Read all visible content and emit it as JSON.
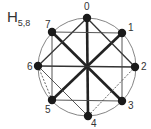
{
  "title": {
    "main": "H",
    "subscript": "5,8"
  },
  "circle": {
    "cx": 87,
    "cy": 67,
    "r": 49,
    "color": "#777777"
  },
  "nodes": [
    {
      "id": "0",
      "x": 87,
      "y": 18,
      "lx": 84,
      "ly": 10
    },
    {
      "id": "1",
      "x": 122,
      "y": 33,
      "lx": 128,
      "ly": 31
    },
    {
      "id": "2",
      "x": 135,
      "y": 67,
      "lx": 141,
      "ly": 70
    },
    {
      "id": "3",
      "x": 122,
      "y": 101,
      "lx": 128,
      "ly": 109
    },
    {
      "id": "4",
      "x": 88,
      "y": 116,
      "lx": 91,
      "ly": 127
    },
    {
      "id": "5",
      "x": 52,
      "y": 100,
      "lx": 45,
      "ly": 113
    },
    {
      "id": "6",
      "x": 38,
      "y": 66,
      "lx": 27,
      "ly": 70
    },
    {
      "id": "7",
      "x": 52,
      "y": 32,
      "lx": 45,
      "ly": 28
    }
  ],
  "edges": [
    {
      "from": 0,
      "to": 4,
      "weight": "thick"
    },
    {
      "from": 7,
      "to": 3,
      "weight": "thick"
    },
    {
      "from": 1,
      "to": 5,
      "weight": "thick"
    },
    {
      "from": 6,
      "to": 2,
      "weight": "medium"
    },
    {
      "from": 0,
      "to": 6,
      "weight": "medium"
    },
    {
      "from": 0,
      "to": 2,
      "weight": "medium"
    },
    {
      "from": 6,
      "to": 4,
      "weight": "thin"
    },
    {
      "from": 4,
      "to": 2,
      "weight": "dashed"
    },
    {
      "from": 7,
      "to": 1,
      "weight": "thin"
    },
    {
      "from": 5,
      "to": 3,
      "weight": "thin"
    },
    {
      "from": 7,
      "to": 5,
      "weight": "thin"
    },
    {
      "from": 1,
      "to": 3,
      "weight": "thin"
    },
    {
      "from": 6,
      "to": 5,
      "weight": "dashed"
    }
  ],
  "styles": {
    "thick": {
      "width": 2.6,
      "color": "#222222",
      "dash": ""
    },
    "medium": {
      "width": 1.3,
      "color": "#333333",
      "dash": ""
    },
    "thin": {
      "width": 0.9,
      "color": "#444444",
      "dash": ""
    },
    "dashed": {
      "width": 0.9,
      "color": "#555555",
      "dash": "2,1.5"
    }
  },
  "node_style": {
    "r": 4.2,
    "color": "#1a1a1a"
  }
}
